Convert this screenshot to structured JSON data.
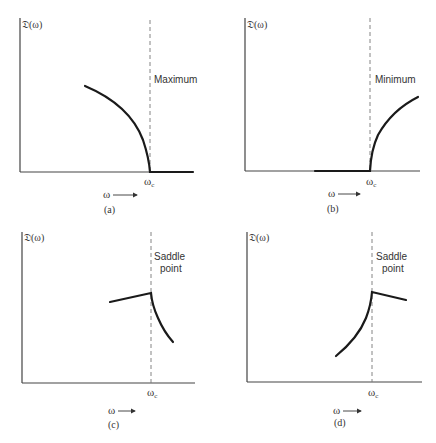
{
  "figure": {
    "panels": [
      {
        "id": "a",
        "caption": "(a)",
        "y_label": "𝔇(ω)",
        "x_label": "ω",
        "critical_label": "ω",
        "critical_sub": "c",
        "annotation_line1": "Maximum",
        "annotation_line2": "",
        "type": "maximum"
      },
      {
        "id": "b",
        "caption": "(b)",
        "y_label": "𝔇(ω)",
        "x_label": "ω",
        "critical_label": "ω",
        "critical_sub": "c",
        "annotation_line1": "Minimum",
        "annotation_line2": "",
        "type": "minimum"
      },
      {
        "id": "c",
        "caption": "(c)",
        "y_label": "𝔇(ω)",
        "x_label": "ω",
        "critical_label": "ω",
        "critical_sub": "c",
        "annotation_line1": "Saddle",
        "annotation_line2": "point",
        "type": "saddle-left-rise"
      },
      {
        "id": "d",
        "caption": "(d)",
        "y_label": "𝔇(ω)",
        "x_label": "ω",
        "critical_label": "ω",
        "critical_sub": "c",
        "annotation_line1": "Saddle",
        "annotation_line2": "point",
        "type": "saddle-right-fall"
      }
    ],
    "arrow_glyph": "⟶",
    "colors": {
      "curve": "#1a1a1a",
      "axis": "#444444",
      "dashed": "#777777"
    }
  }
}
